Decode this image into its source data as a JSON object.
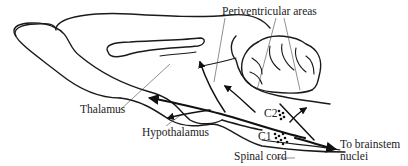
{
  "diagram": {
    "labels": {
      "periventricular": "Periventricular areas",
      "thalamus": "Thalamus",
      "hypothalamus": "Hypothalamus",
      "c2": "C2",
      "c1": "C1",
      "spinal_cord": "Spinal cord",
      "brainstem_line1": "To brainstem",
      "brainstem_line2": "nuclei"
    },
    "nodes": [
      {
        "id": "c2",
        "label": "C2",
        "type": "cell-group"
      },
      {
        "id": "c1",
        "label": "C1",
        "type": "cell-group"
      }
    ],
    "edges": [
      {
        "from": "c1",
        "to": "hypothalamus"
      },
      {
        "from": "c1",
        "to": "thalamus"
      },
      {
        "from": "c1",
        "to": "periventricular areas"
      },
      {
        "from": "c2",
        "to": "periventricular areas"
      },
      {
        "from": "c1",
        "to": "brainstem nuclei"
      },
      {
        "from": "c1",
        "to": "spinal cord"
      }
    ],
    "colors": {
      "ink": "#1a1a1a",
      "background": "#ffffff"
    }
  }
}
